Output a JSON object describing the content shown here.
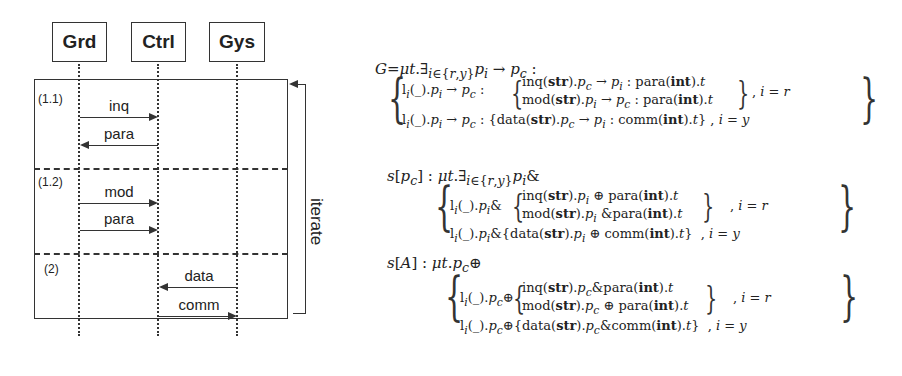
{
  "diagram": {
    "actors": [
      "Grd",
      "Ctrl",
      "Gys"
    ],
    "segments": [
      "(1.1)",
      "(1.2)",
      "(2)"
    ],
    "messages": [
      {
        "label": "inq",
        "from": "Grd",
        "to": "Ctrl",
        "segment": "(1.1)"
      },
      {
        "label": "para",
        "from": "Ctrl",
        "to": "Grd",
        "segment": "(1.1)"
      },
      {
        "label": "mod",
        "from": "Grd",
        "to": "Ctrl",
        "segment": "(1.2)"
      },
      {
        "label": "para",
        "from": "Grd",
        "to": "Ctrl",
        "segment": "(1.2)"
      },
      {
        "label": "data",
        "from": "Gys",
        "to": "Ctrl",
        "segment": "(2)"
      },
      {
        "label": "comm",
        "from": "Ctrl",
        "to": "Gys",
        "segment": "(2)"
      }
    ],
    "loop_label": "iterate"
  },
  "equations": {
    "global": {
      "head": "G=μt.∃i∈{r,y} pi → pc :",
      "rows": [
        {
          "prefix": "li(_).pi → pc :",
          "branches": [
            "inq(str).pc → pi : para(int).t",
            "mod(str).pi → pc : para(int).t"
          ],
          "cond": ", i = r"
        },
        {
          "prefix": "li(_).pi → pc :",
          "branches": [
            "data(str).pc → pi : comm(int).t"
          ],
          "cond": ", i = y"
        }
      ]
    },
    "local_pc": {
      "head": "s[pc] : μt.∃i∈{r,y} pi&",
      "rows": [
        {
          "prefix": "li(_).pi&",
          "branches": [
            "inq(str).pi ⊕ para(int).t",
            "mod(str).pi & para(int).t"
          ],
          "cond": ", i = r"
        },
        {
          "prefix": "li(_).pi&",
          "branches": [
            "data(str).pi ⊕ comm(int).t"
          ],
          "cond": ", i = y"
        }
      ]
    },
    "local_A": {
      "head": "s[A] : μt.pc⊕",
      "rows": [
        {
          "prefix": "li(_).pc⊕",
          "branches": [
            "inq(str).pc & para(int).t",
            "mod(str).pc ⊕ para(int).t"
          ],
          "cond": ", i = r"
        },
        {
          "prefix": "li(_).pc⊕",
          "branches": [
            "data(str).pc & comm(int).t"
          ],
          "cond": ", i = y"
        }
      ]
    }
  }
}
